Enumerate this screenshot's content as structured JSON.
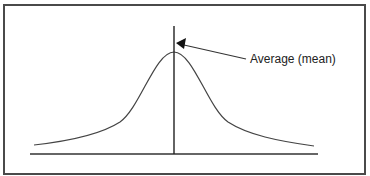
{
  "diagram": {
    "type": "normal-distribution-curve",
    "annotation": {
      "label": "Average (mean)",
      "points_to": "mean-line"
    },
    "elements": [
      "bell-curve",
      "mean-line",
      "baseline-axis",
      "annotation-arrow"
    ],
    "colors": {
      "stroke": "#333333",
      "frame": "#4a4a4a",
      "background": "#ffffff"
    }
  }
}
